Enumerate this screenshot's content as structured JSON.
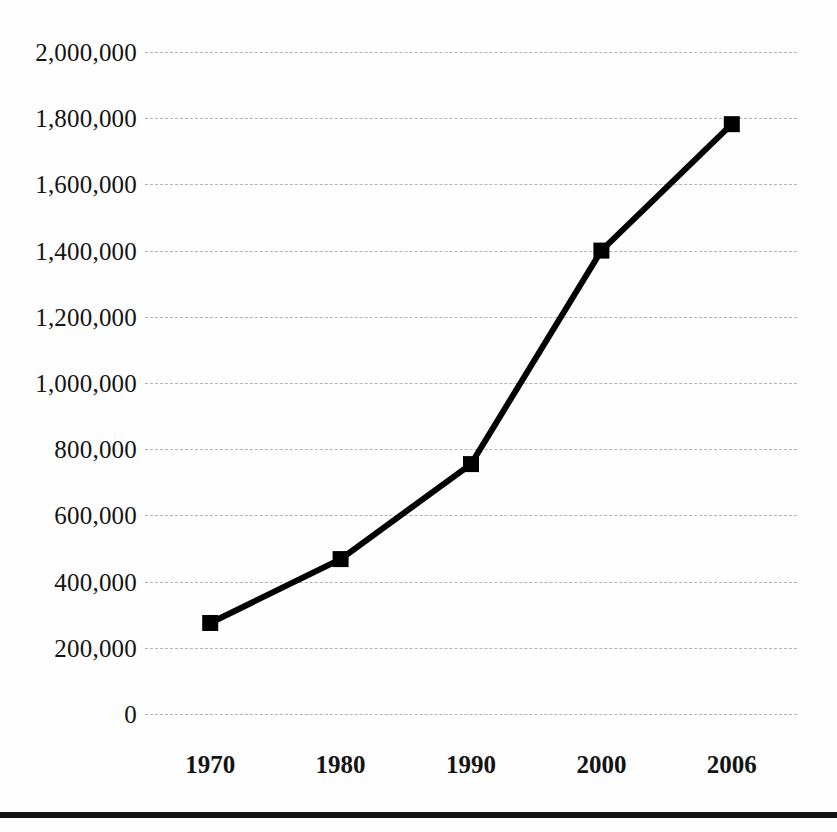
{
  "chart_data": {
    "type": "line",
    "title": "",
    "subtitle": "",
    "xlabel": "",
    "ylabel": "",
    "categories": [
      "1970",
      "1980",
      "1990",
      "2000",
      "2006"
    ],
    "x": [
      1970,
      1980,
      1990,
      2000,
      2006
    ],
    "values": [
      275000,
      468000,
      755000,
      1400000,
      1782000
    ],
    "series": [
      {
        "name": "",
        "values": [
          275000,
          468000,
          755000,
          1400000,
          1782000
        ]
      }
    ],
    "ylim": [
      0,
      2000000
    ],
    "ytick_values": [
      0,
      200000,
      400000,
      600000,
      800000,
      1000000,
      1200000,
      1400000,
      1600000,
      1800000,
      2000000
    ],
    "ytick_labels": [
      "0",
      "200,000",
      "400,000",
      "600,000",
      "800,000",
      "1,000,000",
      "1,200,000",
      "1,400,000",
      "1,600,000",
      "1,800,000",
      "2,000,000"
    ],
    "xtick_labels": [
      "1970",
      "1980",
      "1990",
      "2000",
      "2006"
    ],
    "grid": {
      "horizontal": true,
      "vertical": false,
      "style": "dashed",
      "color": "#b4b4b4"
    },
    "legend": {
      "visible": false,
      "position": "none",
      "entries": []
    },
    "marker": {
      "shape": "square",
      "color": "#000000",
      "size": 16
    },
    "line": {
      "color": "#000000",
      "width": 6,
      "style": "solid"
    },
    "annotations": [],
    "footer_rule": {
      "visible": true,
      "color": "#111111"
    }
  }
}
